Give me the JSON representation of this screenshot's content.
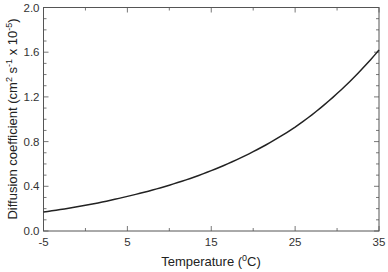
{
  "chart_data": {
    "type": "line",
    "title": "",
    "xlabel": "Temperature (⁰C)",
    "xlabel_parts": {
      "pre": "Temperature (",
      "sup": "0",
      "post": "C)"
    },
    "ylabel": "Diffusion coefficient (cm² s⁻¹ x 10⁻⁵)",
    "ylabel_parts": [
      {
        "t": "Diffusion coefficient (cm",
        "sup": false
      },
      {
        "t": "2",
        "sup": true
      },
      {
        "t": " s",
        "sup": false
      },
      {
        "t": "-1",
        "sup": true
      },
      {
        "t": " x 10",
        "sup": false
      },
      {
        "t": "-5",
        "sup": true
      },
      {
        "t": ")",
        "sup": false
      }
    ],
    "xlim": [
      -5,
      35
    ],
    "ylim": [
      0,
      2.0
    ],
    "xticks": [
      -5,
      5,
      15,
      25,
      35
    ],
    "xtick_labels": [
      "-5",
      "5",
      "15",
      "25",
      "35"
    ],
    "xminor_step": 5,
    "yticks": [
      0,
      0.4,
      0.8,
      1.2,
      1.6,
      2.0
    ],
    "ytick_labels": [
      "0.0",
      "0.4",
      "0.8",
      "1.2",
      "1.6",
      "2.0"
    ],
    "yminor_step": 0.1,
    "grid": false,
    "legend": null,
    "series": [
      {
        "name": "Diffusion coefficient",
        "color": "#222222",
        "x": [
          -5,
          0,
          5,
          10,
          15,
          20,
          25,
          30,
          35
        ],
        "values": [
          0.17,
          0.23,
          0.31,
          0.41,
          0.54,
          0.71,
          0.93,
          1.23,
          1.62
        ]
      }
    ]
  },
  "colors": {
    "frame": "#555555",
    "line": "#222222",
    "text": "#333333"
  }
}
